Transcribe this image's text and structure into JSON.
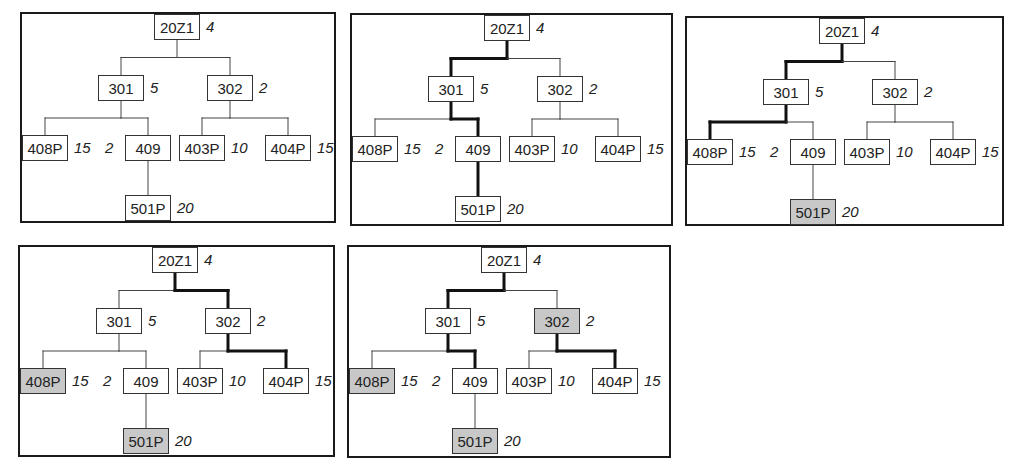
{
  "diagram": {
    "colors": {
      "border": "#1a1a1a",
      "line": "#333333",
      "shaded_fill": "#c8c8c8",
      "background": "#ffffff"
    },
    "nodes": [
      {
        "id": "20Z1",
        "label": "20Z1",
        "weight": "4"
      },
      {
        "id": "301",
        "label": "301",
        "weight": "5"
      },
      {
        "id": "302",
        "label": "302",
        "weight": "2"
      },
      {
        "id": "408P",
        "label": "408P",
        "weight": "15"
      },
      {
        "id": "409",
        "label": "409",
        "weight": "2"
      },
      {
        "id": "403P",
        "label": "403P",
        "weight": "10"
      },
      {
        "id": "404P",
        "label": "404P",
        "weight": "15"
      },
      {
        "id": "501P",
        "label": "501P",
        "weight": "20"
      }
    ],
    "edges": [
      [
        "20Z1",
        "301"
      ],
      [
        "20Z1",
        "302"
      ],
      [
        "301",
        "408P"
      ],
      [
        "301",
        "409"
      ],
      [
        "302",
        "403P"
      ],
      [
        "302",
        "404P"
      ],
      [
        "409",
        "501P"
      ]
    ],
    "panels": [
      {
        "index": 1,
        "bold_edges": [],
        "shaded": []
      },
      {
        "index": 2,
        "bold_edges": [
          [
            "20Z1",
            "301"
          ],
          [
            "301",
            "409"
          ],
          [
            "409",
            "501P"
          ]
        ],
        "shaded": []
      },
      {
        "index": 3,
        "bold_edges": [
          [
            "20Z1",
            "301"
          ],
          [
            "301",
            "408P"
          ]
        ],
        "shaded": [
          "501P"
        ]
      },
      {
        "index": 4,
        "bold_edges": [
          [
            "20Z1",
            "302"
          ],
          [
            "302",
            "404P"
          ]
        ],
        "shaded": [
          "408P",
          "501P"
        ]
      },
      {
        "index": 5,
        "bold_edges": [
          [
            "20Z1",
            "301"
          ],
          [
            "301",
            "409"
          ],
          [
            "302",
            "404P"
          ]
        ],
        "shaded": [
          "302",
          "408P",
          "501P"
        ]
      }
    ]
  }
}
